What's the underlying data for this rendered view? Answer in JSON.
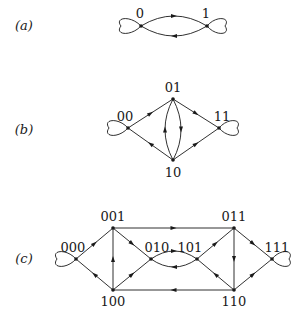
{
  "panels": [
    {
      "id": "a",
      "label": "(a)",
      "label_pos": [
        24,
        30
      ],
      "nodes": [
        {
          "id": "0",
          "label": "0",
          "x": 141,
          "y": 26,
          "lx": 140,
          "ly": 18
        },
        {
          "id": "1",
          "label": "1",
          "x": 207,
          "y": 26,
          "lx": 206,
          "ly": 18
        }
      ],
      "loops": [
        {
          "node": "0",
          "side": "left",
          "w": 20,
          "h": 9
        },
        {
          "node": "1",
          "side": "right",
          "w": 18,
          "h": 9
        }
      ],
      "edges": [
        {
          "from": "0",
          "to": "1",
          "curve": -10
        },
        {
          "from": "1",
          "to": "0",
          "curve": -10
        }
      ]
    },
    {
      "id": "b",
      "label": "(b)",
      "label_pos": [
        24,
        134
      ],
      "nodes": [
        {
          "id": "00",
          "label": "00",
          "x": 128,
          "y": 128,
          "lx": 125,
          "ly": 121
        },
        {
          "id": "01",
          "label": "01",
          "x": 173,
          "y": 99,
          "lx": 173,
          "ly": 92
        },
        {
          "id": "11",
          "label": "11",
          "x": 219,
          "y": 128,
          "lx": 222,
          "ly": 121
        },
        {
          "id": "10",
          "label": "10",
          "x": 173,
          "y": 160,
          "lx": 173,
          "ly": 177
        }
      ],
      "loops": [
        {
          "node": "00",
          "side": "left",
          "w": 19,
          "h": 9
        },
        {
          "node": "11",
          "side": "right",
          "w": 18,
          "h": 9
        }
      ],
      "edges": [
        {
          "from": "00",
          "to": "01",
          "curve": 0
        },
        {
          "from": "01",
          "to": "11",
          "curve": 0
        },
        {
          "from": "10",
          "to": "00",
          "curve": 0
        },
        {
          "from": "10",
          "to": "11",
          "curve": 0
        },
        {
          "from": "10",
          "to": "01",
          "curve": -8
        },
        {
          "from": "01",
          "to": "10",
          "curve": -8
        }
      ]
    },
    {
      "id": "c",
      "label": "(c)",
      "label_pos": [
        24,
        263
      ],
      "nodes": [
        {
          "id": "000",
          "label": "000",
          "x": 76,
          "y": 259,
          "lx": 73,
          "ly": 252
        },
        {
          "id": "001",
          "label": "001",
          "x": 113,
          "y": 228,
          "lx": 113,
          "ly": 221
        },
        {
          "id": "100",
          "label": "100",
          "x": 113,
          "y": 290,
          "lx": 113,
          "ly": 306
        },
        {
          "id": "010",
          "label": "010",
          "x": 151,
          "y": 259,
          "lx": 157,
          "ly": 252
        },
        {
          "id": "101",
          "label": "101",
          "x": 197,
          "y": 259,
          "lx": 190,
          "ly": 252
        },
        {
          "id": "011",
          "label": "011",
          "x": 234,
          "y": 228,
          "lx": 234,
          "ly": 221
        },
        {
          "id": "110",
          "label": "110",
          "x": 234,
          "y": 290,
          "lx": 234,
          "ly": 306
        },
        {
          "id": "111",
          "label": "111",
          "x": 272,
          "y": 259,
          "lx": 277,
          "ly": 252
        }
      ],
      "loops": [
        {
          "node": "000",
          "side": "left",
          "w": 19,
          "h": 9
        },
        {
          "node": "111",
          "side": "right",
          "w": 17,
          "h": 9
        }
      ],
      "edges": [
        {
          "from": "000",
          "to": "001",
          "curve": 0
        },
        {
          "from": "100",
          "to": "000",
          "curve": 0
        },
        {
          "from": "100",
          "to": "001",
          "curve": 0
        },
        {
          "from": "001",
          "to": "010",
          "curve": 0
        },
        {
          "from": "100",
          "to": "010",
          "curve": 0
        },
        {
          "from": "001",
          "to": "011",
          "curve": 0
        },
        {
          "from": "110",
          "to": "100",
          "curve": 0
        },
        {
          "from": "010",
          "to": "101",
          "curve": -8
        },
        {
          "from": "101",
          "to": "010",
          "curve": -8
        },
        {
          "from": "101",
          "to": "011",
          "curve": 0
        },
        {
          "from": "110",
          "to": "101",
          "curve": 0
        },
        {
          "from": "011",
          "to": "110",
          "curve": 0
        },
        {
          "from": "011",
          "to": "111",
          "curve": 0
        },
        {
          "from": "110",
          "to": "111",
          "curve": 0
        }
      ]
    }
  ],
  "style": {
    "stroke": "#1a1a1a",
    "background": "#ffffff"
  }
}
